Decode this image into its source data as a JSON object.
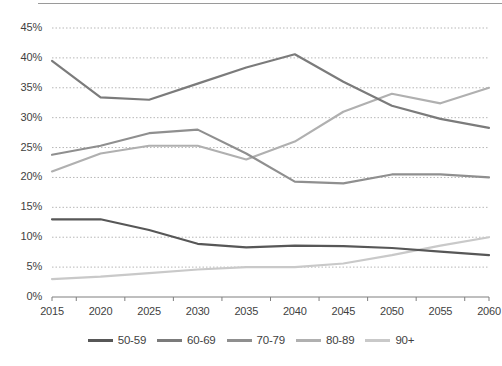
{
  "chart_data": {
    "type": "line",
    "title": "",
    "subtitle": "",
    "xlabel": "",
    "ylabel": "",
    "x": [
      2015,
      2020,
      2025,
      2030,
      2035,
      2040,
      2045,
      2050,
      2055,
      2060
    ],
    "categories": [
      "2015",
      "2020",
      "2025",
      "2030",
      "2035",
      "2040",
      "2045",
      "2050",
      "2055",
      "2060"
    ],
    "xtick_labels": [
      "2015",
      "2020",
      "2025",
      "2030",
      "2035",
      "2040",
      "2045",
      "2050",
      "2055",
      "2060"
    ],
    "ytick_labels": [
      "0%",
      "5%",
      "10%",
      "15%",
      "20%",
      "25%",
      "30%",
      "35%",
      "40%",
      "45%"
    ],
    "ytick_values": [
      0,
      5,
      10,
      15,
      20,
      25,
      30,
      35,
      40,
      45
    ],
    "ylim": [
      0,
      45
    ],
    "xlim": [
      2015,
      2060
    ],
    "grid": "horizontal-dotted",
    "legend_position": "bottom",
    "value_unit": "percent",
    "series": [
      {
        "name": "50-59",
        "color": "#575757",
        "values": [
          13.0,
          13.0,
          11.2,
          8.9,
          8.3,
          8.6,
          8.5,
          8.2,
          7.6,
          7.0
        ]
      },
      {
        "name": "60-69",
        "color": "#7b7b7b",
        "values": [
          39.5,
          33.4,
          33.0,
          35.7,
          38.4,
          40.6,
          36.0,
          32.0,
          29.8,
          28.3
        ]
      },
      {
        "name": "70-79",
        "color": "#8f8f8f",
        "values": [
          23.8,
          25.3,
          27.4,
          28.0,
          24.0,
          19.3,
          19.0,
          20.5,
          20.5,
          20.0
        ]
      },
      {
        "name": "80-89",
        "color": "#b0b0b0",
        "values": [
          21.0,
          24.0,
          25.3,
          25.3,
          23.0,
          26.0,
          31.0,
          34.0,
          32.4,
          35.0
        ]
      },
      {
        "name": "90+",
        "color": "#c9c9c9",
        "values": [
          3.0,
          3.4,
          4.0,
          4.6,
          5.0,
          5.0,
          5.6,
          7.0,
          8.6,
          10.0
        ]
      }
    ]
  },
  "legend": {
    "items": [
      {
        "label": "50-59"
      },
      {
        "label": "60-69"
      },
      {
        "label": "70-79"
      },
      {
        "label": "80-89"
      },
      {
        "label": "90+"
      }
    ]
  },
  "colors": {
    "axis": "#7f7f7f",
    "grid": "#b7b7b7",
    "tick_text": "#3f3f3f",
    "background": "#ffffff"
  }
}
